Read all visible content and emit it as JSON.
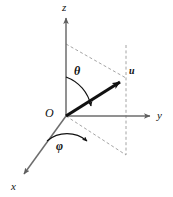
{
  "figure": {
    "kind": "spherical-coordinate-diagram",
    "background_color": "#ffffff",
    "axis_color": "#6d6d6d",
    "vector_color": "#111111",
    "dashed_color": "#9a9a9a",
    "arc_color": "#111111",
    "labels": {
      "z_axis": "z",
      "y_axis": "y",
      "x_axis": "x",
      "origin": "O",
      "vector": "u",
      "polar_angle": "θ",
      "azimuthal_angle": "φ"
    },
    "geometry": {
      "origin": [
        66,
        116
      ],
      "z_axis_tip": [
        66,
        16
      ],
      "y_axis_tip": [
        152,
        116
      ],
      "x_axis_tip": [
        22,
        177
      ],
      "vector_tip": [
        124,
        79
      ],
      "projection_point": [
        126,
        155
      ],
      "dashed_top_start": [
        66,
        44
      ],
      "dashed_top_end": [
        126,
        78
      ],
      "dashed_vertical_top": [
        126,
        45
      ],
      "dashed_vertical_bottom": [
        126,
        155
      ]
    }
  }
}
